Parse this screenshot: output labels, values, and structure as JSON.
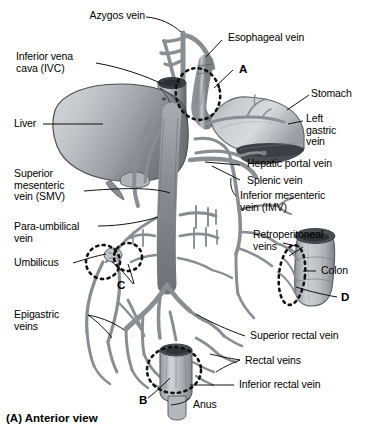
{
  "figure": {
    "caption": "(A) Anterior view",
    "background_color": "#ffffff",
    "vessel_color": "#8f9296",
    "organ_color": "#b9bcbf",
    "line_color": "#1a1a1a"
  },
  "labels": {
    "azygos_vein": "Azygos vein",
    "esophageal_vein": "Esophageal vein",
    "inferior_vena_cava": "Inferior vena\ncava (IVC)",
    "stomach": "Stomach",
    "liver": "Liver",
    "left_gastric_vein": "Left\ngastric\nvein",
    "hepatic_portal_vein": "Hepatic portal vein",
    "superior_mesenteric_vein": "Superior\nmesenteric\nvein (SMV)",
    "splenic_vein": "Splenic vein",
    "inferior_mesenteric_vein": "Inferior mesenteric\nvein (IMV)",
    "para_umbilical_vein": "Para-umbilical\nvein",
    "retroperitoneal_veins": "Retroperitoneal\nveins",
    "umbilicus": "Umbilicus",
    "colon": "Colon",
    "epigastric_veins": "Epigastric\nveins",
    "superior_rectal_vein": "Superior rectal vein",
    "rectal_veins": "Rectal veins",
    "inferior_rectal_vein": "Inferior rectal vein",
    "anus": "Anus"
  },
  "markers": {
    "a": "A",
    "b": "B",
    "c": "C",
    "d": "D"
  }
}
